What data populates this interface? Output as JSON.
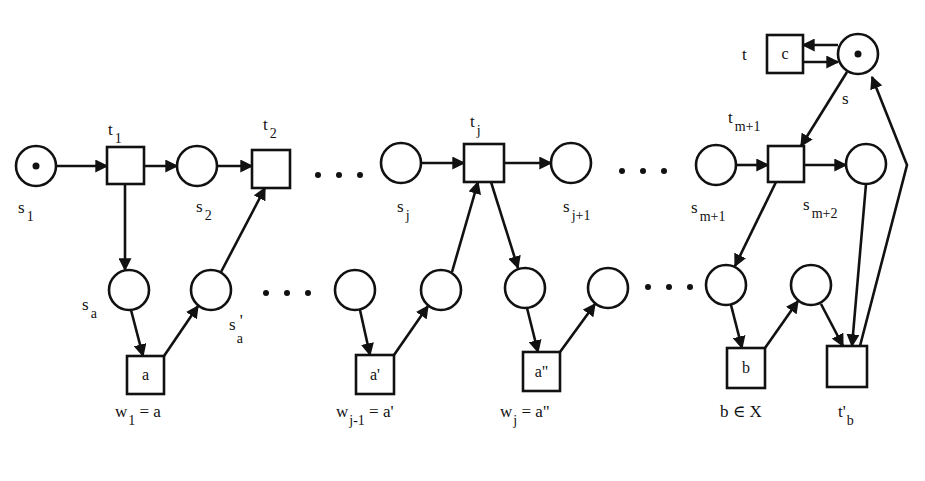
{
  "diagram": {
    "type": "petri-net",
    "colors": {
      "stroke": "#111111",
      "background": "#ffffff"
    },
    "places": [
      {
        "id": "s1",
        "cx": 36,
        "cy": 166,
        "r": 20,
        "token": true
      },
      {
        "id": "p_t1_out",
        "cx": 197,
        "cy": 166,
        "r": 20,
        "token": false
      },
      {
        "id": "sj",
        "cx": 401,
        "cy": 163,
        "r": 20,
        "token": false
      },
      {
        "id": "sj1",
        "cx": 571,
        "cy": 163,
        "r": 20,
        "token": false
      },
      {
        "id": "sm1",
        "cx": 716,
        "cy": 165,
        "r": 20,
        "token": false
      },
      {
        "id": "sm2",
        "cx": 866,
        "cy": 164,
        "r": 20,
        "token": false
      },
      {
        "id": "s",
        "cx": 858,
        "cy": 54,
        "r": 20,
        "token": true
      },
      {
        "id": "sa",
        "cx": 129,
        "cy": 290,
        "r": 20,
        "token": false
      },
      {
        "id": "sa_prime",
        "cx": 211,
        "cy": 290,
        "r": 20,
        "token": false
      },
      {
        "id": "q1",
        "cx": 355,
        "cy": 290,
        "r": 20,
        "token": false
      },
      {
        "id": "q2",
        "cx": 441,
        "cy": 290,
        "r": 20,
        "token": false
      },
      {
        "id": "q3",
        "cx": 525,
        "cy": 288,
        "r": 20,
        "token": false
      },
      {
        "id": "q4",
        "cx": 608,
        "cy": 288,
        "r": 20,
        "token": false
      },
      {
        "id": "q5",
        "cx": 726,
        "cy": 285,
        "r": 20,
        "token": false
      },
      {
        "id": "q6",
        "cx": 811,
        "cy": 285,
        "r": 20,
        "token": false
      }
    ],
    "transitions": [
      {
        "id": "t1",
        "x": 107,
        "y": 147,
        "w": 37,
        "h": 37,
        "label": ""
      },
      {
        "id": "t2",
        "x": 252,
        "y": 150,
        "w": 38,
        "h": 38,
        "label": ""
      },
      {
        "id": "tj",
        "x": 464,
        "y": 144,
        "w": 40,
        "h": 38,
        "label": ""
      },
      {
        "id": "tm1",
        "x": 768,
        "y": 146,
        "w": 36,
        "h": 36,
        "label": ""
      },
      {
        "id": "tc",
        "x": 767,
        "y": 35,
        "w": 36,
        "h": 38,
        "label": "c"
      },
      {
        "id": "ta",
        "x": 127,
        "y": 356,
        "w": 37,
        "h": 38,
        "label": "a"
      },
      {
        "id": "ta1",
        "x": 356,
        "y": 355,
        "w": 38,
        "h": 39,
        "label": "a'"
      },
      {
        "id": "ta2",
        "x": 523,
        "y": 352,
        "w": 37,
        "h": 39,
        "label": "a\""
      },
      {
        "id": "tb",
        "x": 727,
        "y": 348,
        "w": 38,
        "h": 40,
        "label": "b"
      },
      {
        "id": "tb_prime",
        "x": 827,
        "y": 346,
        "w": 40,
        "h": 41,
        "label": ""
      }
    ],
    "arcs": [
      {
        "from": [
          56,
          166
        ],
        "to": [
          107,
          166
        ]
      },
      {
        "from": [
          144,
          166
        ],
        "to": [
          177,
          166
        ]
      },
      {
        "from": [
          217,
          166
        ],
        "to": [
          252,
          166
        ]
      },
      {
        "from": [
          125,
          184
        ],
        "to": [
          125,
          270
        ]
      },
      {
        "from": [
          131,
          310
        ],
        "to": [
          143,
          356
        ]
      },
      {
        "from": [
          164,
          356
        ],
        "to": [
          198,
          306
        ]
      },
      {
        "from": [
          221,
          272
        ],
        "to": [
          265,
          188
        ]
      },
      {
        "from": [
          421,
          163
        ],
        "to": [
          464,
          163
        ]
      },
      {
        "from": [
          504,
          163
        ],
        "to": [
          551,
          163
        ]
      },
      {
        "from": [
          360,
          310
        ],
        "to": [
          370,
          355
        ]
      },
      {
        "from": [
          394,
          355
        ],
        "to": [
          428,
          306
        ]
      },
      {
        "from": [
          452,
          272
        ],
        "to": [
          478,
          182
        ]
      },
      {
        "from": [
          491,
          182
        ],
        "to": [
          518,
          268
        ]
      },
      {
        "from": [
          527,
          308
        ],
        "to": [
          538,
          352
        ]
      },
      {
        "from": [
          560,
          352
        ],
        "to": [
          595,
          304
        ]
      },
      {
        "from": [
          736,
          165
        ],
        "to": [
          768,
          165
        ]
      },
      {
        "from": [
          804,
          165
        ],
        "to": [
          846,
          165
        ]
      },
      {
        "from": [
          847,
          72
        ],
        "to": [
          801,
          146
        ]
      },
      {
        "from": [
          776,
          182
        ],
        "to": [
          735,
          266
        ]
      },
      {
        "from": [
          731,
          305
        ],
        "to": [
          742,
          348
        ]
      },
      {
        "from": [
          765,
          348
        ],
        "to": [
          798,
          301
        ]
      },
      {
        "from": [
          821,
          304
        ],
        "to": [
          843,
          346
        ]
      },
      {
        "from": [
          866,
          184
        ],
        "to": [
          852,
          346
        ]
      },
      {
        "from": [
          838,
          45
        ],
        "to": [
          803,
          45
        ]
      },
      {
        "from": [
          803,
          62
        ],
        "to": [
          838,
          62
        ]
      }
    ],
    "return_arc": {
      "points": [
        [
          860,
          346
        ],
        [
          907,
          165
        ],
        [
          872,
          77
        ]
      ]
    },
    "ellipses": [
      {
        "x": 318,
        "y": 175,
        "count": 3,
        "spacing": 21
      },
      {
        "x": 266,
        "y": 293,
        "count": 3,
        "spacing": 21
      },
      {
        "x": 622,
        "y": 171,
        "count": 3,
        "spacing": 21
      },
      {
        "x": 648,
        "y": 287,
        "count": 3,
        "spacing": 21
      }
    ],
    "labels": {
      "t1": {
        "main": "t",
        "sub": "1",
        "x": 108,
        "y": 135
      },
      "t2": {
        "main": "t",
        "sub": "2",
        "x": 263,
        "y": 130
      },
      "tj": {
        "main": "t",
        "sub": "j",
        "x": 470,
        "y": 127
      },
      "tm1": {
        "main": "t",
        "sub": "m+1",
        "x": 728,
        "y": 123
      },
      "t": {
        "main": "t",
        "sub": "",
        "x": 742,
        "y": 60
      },
      "s": {
        "main": "s",
        "sub": "",
        "x": 842,
        "y": 104
      },
      "s1": {
        "main": "s",
        "sub": "1",
        "x": 18,
        "y": 213
      },
      "s2": {
        "main": "s",
        "sub": "2",
        "x": 196,
        "y": 212
      },
      "sj": {
        "main": "s",
        "sub": "j",
        "x": 397,
        "y": 212
      },
      "sj1": {
        "main": "s",
        "sub": "j+1",
        "x": 563,
        "y": 212
      },
      "sm1": {
        "main": "s",
        "sub": "m+1",
        "x": 691,
        "y": 213
      },
      "sm2": {
        "main": "s",
        "sub": "m+2",
        "x": 803,
        "y": 210
      },
      "sa": {
        "main": "s",
        "sub": "a",
        "x": 82,
        "y": 310
      },
      "sa_prime": {
        "main": "s",
        "sub": "a",
        "prime": "'",
        "x": 229,
        "y": 330
      }
    },
    "captions": [
      {
        "id": "w1",
        "main": "w",
        "sub": "1",
        "rest": " = a",
        "x": 115,
        "y": 417
      },
      {
        "id": "wj1",
        "main": "w",
        "sub": "j-1",
        "rest": " = a'",
        "x": 336,
        "y": 417
      },
      {
        "id": "wj",
        "main": "w",
        "sub": "j",
        "rest": " = a\"",
        "x": 500,
        "y": 417
      },
      {
        "id": "bx",
        "main": "b ∈ X",
        "sub": "",
        "rest": "",
        "x": 720,
        "y": 417
      },
      {
        "id": "tb",
        "main": "t'",
        "sub": "b",
        "rest": "",
        "x": 838,
        "y": 417
      }
    ]
  }
}
